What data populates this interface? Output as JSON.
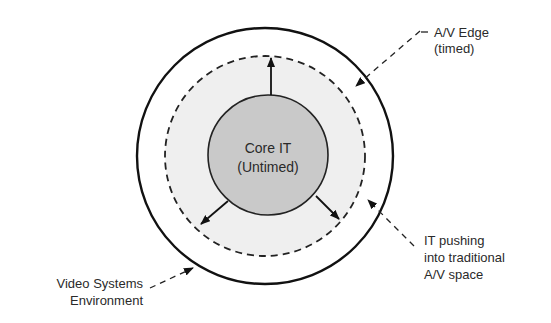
{
  "diagram": {
    "core": {
      "line1": "Core IT",
      "line2": "(Untimed)",
      "fill": "#c8c8c8"
    },
    "edge_zone": {
      "fill": "#f0f0f0"
    },
    "labels": {
      "av_edge": {
        "line1": "A/V Edge",
        "line2": "(timed)"
      },
      "it_pushing": {
        "line1": "IT pushing",
        "line2": "into traditional",
        "line3": "A/V space"
      },
      "video_env": {
        "line1": "Video Systems",
        "line2": "Environment"
      }
    },
    "stroke_color": "#111111"
  }
}
